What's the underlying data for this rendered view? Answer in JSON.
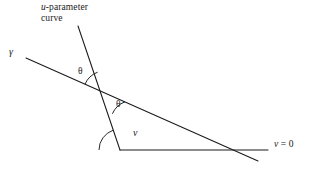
{
  "figure": {
    "background_color": "#ffffff",
    "stroke_color": "#1a1a1a",
    "labels": {
      "u_parameter_line1": "u",
      "u_parameter_line1_rest": "-parameter",
      "u_parameter_line2": "curve",
      "gamma": "γ",
      "theta_upper": "θ",
      "theta_lower": "θ",
      "v_angle": "v",
      "v_zero_var": "v",
      "v_zero_rest": " = 0"
    },
    "geometry": {
      "type": "line-diagram",
      "canvas": {
        "width": 314,
        "height": 175
      },
      "lines": [
        {
          "name": "gamma-curve",
          "from": [
            26,
            58
          ],
          "to": [
            258,
            161
          ],
          "stroke_width": 1.0
        },
        {
          "name": "u-parameter-curve",
          "from": [
            78,
            26
          ],
          "to": [
            120,
            150
          ],
          "stroke_width": 1.0
        },
        {
          "name": "v-equals-zero-line",
          "from": [
            120,
            150
          ],
          "to": [
            268,
            150
          ],
          "stroke_width": 1.0
        }
      ],
      "intersection_point": [
        105,
        93
      ],
      "vertex_point": [
        120,
        150
      ],
      "angle_arcs": [
        {
          "name": "theta-upper-arc",
          "center": [
            105,
            93
          ],
          "radius": 22,
          "start_deg": 204,
          "end_deg": 251
        },
        {
          "name": "theta-lower-arc",
          "center": [
            105,
            93
          ],
          "radius": 22,
          "start_deg": 24,
          "end_deg": 71
        },
        {
          "name": "v-angle-arc",
          "center": [
            120,
            150
          ],
          "radius": 21,
          "start_deg": 180,
          "end_deg": 251
        }
      ]
    }
  }
}
